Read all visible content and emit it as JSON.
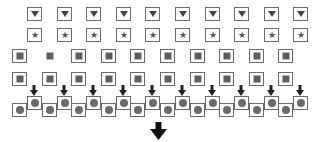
{
  "diagram": {
    "colors": {
      "frame": "#6a6a6a",
      "glyph": "#4a4a4a",
      "background": "#ffffff"
    },
    "rows": [
      {
        "name": "triangle-row",
        "shape": "triangle-down",
        "count": 10,
        "x_start": 27,
        "y": 7,
        "spacing": 29.6,
        "framed": [
          true,
          true,
          true,
          true,
          true,
          true,
          true,
          true,
          true,
          true
        ]
      },
      {
        "name": "star-row",
        "shape": "star",
        "count": 10,
        "x_start": 27,
        "y": 28,
        "spacing": 29.6,
        "framed": [
          true,
          true,
          true,
          true,
          true,
          true,
          true,
          true,
          true,
          true
        ]
      },
      {
        "name": "square-row-1",
        "shape": "square",
        "count": 10,
        "x_start": 12,
        "y": 49,
        "spacing": 29.6,
        "framed": [
          true,
          false,
          true,
          true,
          true,
          true,
          true,
          true,
          true,
          true
        ]
      },
      {
        "name": "square-row-2",
        "shape": "square",
        "count": 10,
        "x_start": 12,
        "y": 72,
        "spacing": 29.6,
        "framed": [
          true,
          true,
          true,
          true,
          true,
          true,
          true,
          true,
          true,
          true
        ]
      }
    ],
    "small_arrows": {
      "count": 10,
      "x_start": 30,
      "y": 85,
      "spacing": 29.6,
      "glyph": "arrow-down"
    },
    "chain": {
      "shape": "circle",
      "upper": {
        "count": 10,
        "x_start": 27,
        "y": 96,
        "spacing": 29.6
      },
      "lower": {
        "count": 10,
        "x_start": 12,
        "y": 103,
        "spacing": 29.6
      }
    },
    "big_arrow": {
      "x": 150,
      "y": 122,
      "glyph": "arrow-down"
    }
  }
}
